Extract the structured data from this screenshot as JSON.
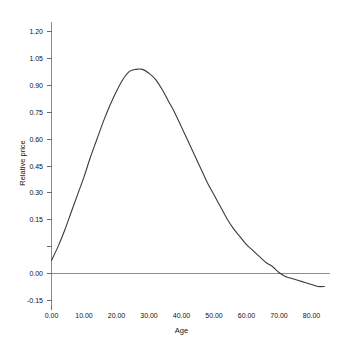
{
  "chart_data": {
    "type": "line",
    "title": "",
    "xlabel": "Age",
    "ylabel": "Relative price",
    "xlim": [
      0,
      84
    ],
    "ylim": [
      -0.15,
      1.2
    ],
    "grid": false,
    "legend": null,
    "x_ticks": [
      0,
      10,
      20,
      30,
      40,
      50,
      60,
      70,
      80
    ],
    "x_tick_labels": [
      "0.00",
      "10.00",
      "20.00",
      "30.00",
      "40.00",
      "50.00",
      "60.00",
      "70.00",
      "80.00"
    ],
    "y_ticks": [
      -0.15,
      0.0,
      0.15,
      0.3,
      0.45,
      0.6,
      0.75,
      0.9,
      1.05,
      1.2
    ],
    "y_tick_labels": [
      "-0.15",
      "0.00",
      "0.15",
      "0.30",
      "0.45",
      "0.60",
      "0.75",
      "0.90",
      "1.05",
      "1.20"
    ],
    "zero_reference_line": 0.0,
    "series": [
      {
        "name": "Relative price",
        "color": "#3a3a3a",
        "x": [
          0,
          2,
          4,
          6,
          8,
          10,
          12,
          14,
          16,
          18,
          20,
          22,
          24,
          26,
          28,
          30,
          32,
          34,
          36,
          38,
          40,
          42,
          44,
          46,
          48,
          50,
          52,
          54,
          56,
          58,
          60,
          62,
          64,
          66,
          68,
          70,
          72,
          74,
          76,
          78,
          80,
          82,
          84
        ],
        "values": [
          0.05,
          0.12,
          0.2,
          0.29,
          0.38,
          0.47,
          0.57,
          0.66,
          0.75,
          0.83,
          0.9,
          0.96,
          1.0,
          1.01,
          1.01,
          0.99,
          0.96,
          0.91,
          0.85,
          0.79,
          0.72,
          0.65,
          0.58,
          0.51,
          0.44,
          0.38,
          0.32,
          0.26,
          0.21,
          0.17,
          0.13,
          0.1,
          0.07,
          0.04,
          0.02,
          -0.01,
          -0.03,
          -0.04,
          -0.05,
          -0.06,
          -0.07,
          -0.08,
          -0.08
        ]
      }
    ],
    "annotations": {
      "peak_age": 26,
      "peak_value": 1.01,
      "zero_crossing_age": 68,
      "start_value": 0.05,
      "end_value": -0.08
    }
  }
}
